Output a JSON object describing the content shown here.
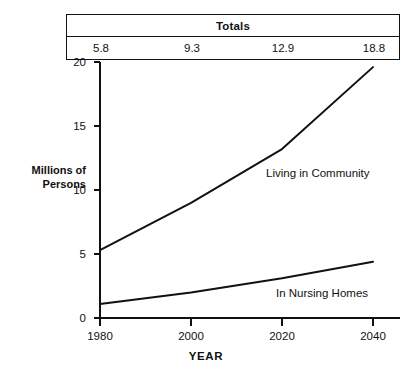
{
  "totals_panel": {
    "title": "Totals",
    "values": [
      "5.8",
      "9.3",
      "12.9",
      "18.8"
    ]
  },
  "axis": {
    "y_title_line1": "Millions of",
    "y_title_line2": "Persons",
    "x_title": "YEAR",
    "y_ticks": [
      "0",
      "5",
      "10",
      "15",
      "20"
    ],
    "x_ticks": [
      "1980",
      "2000",
      "2020",
      "2040"
    ]
  },
  "series_labels": {
    "community": "Living in Community",
    "nursing": "In Nursing Homes"
  },
  "colors": {
    "ink": "#111111",
    "background": "#ffffff"
  },
  "chart_data": {
    "type": "line",
    "title": "",
    "xlabel": "YEAR",
    "ylabel": "Millions of Persons",
    "x": [
      1980,
      2000,
      2020,
      2040
    ],
    "xlim": [
      1980,
      2040
    ],
    "ylim": [
      0,
      20
    ],
    "yticks": [
      0,
      5,
      10,
      15,
      20
    ],
    "xticks": [
      1980,
      2000,
      2020,
      2040
    ],
    "grid": false,
    "legend": "inline-annotations",
    "series": [
      {
        "name": "Living in Community",
        "values": [
          5.3,
          9.0,
          13.2,
          19.6
        ]
      },
      {
        "name": "In Nursing Homes",
        "values": [
          1.1,
          2.0,
          3.1,
          4.4
        ]
      }
    ],
    "annotations": [
      {
        "text": "Totals",
        "values": [
          5.8,
          9.3,
          12.9,
          18.8
        ],
        "position": "top-table"
      }
    ]
  }
}
